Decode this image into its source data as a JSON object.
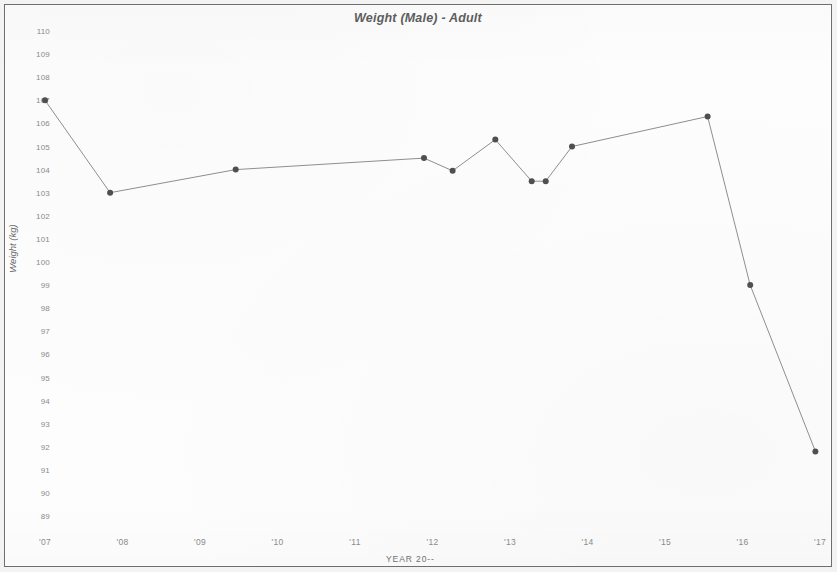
{
  "chart_data": {
    "type": "line",
    "title": "Weight (Male) - Adult",
    "xlabel": "YEAR 20--",
    "ylabel": "Weight (kg)",
    "ylim": [
      89,
      110
    ],
    "xlim": [
      2007,
      2017
    ],
    "grid": false,
    "legend": null,
    "y_ticks": [
      110,
      109,
      108,
      107,
      106,
      105,
      104,
      103,
      102,
      101,
      100,
      99,
      98,
      97,
      96,
      95,
      94,
      93,
      92,
      91,
      90,
      89
    ],
    "x_ticks": [
      2007,
      2008,
      2009,
      2010,
      2011,
      2012,
      2013,
      2014,
      2015,
      2016,
      2017
    ],
    "x_tick_labels": [
      "'07",
      "'08",
      "'09",
      "'10",
      "'11",
      "'12",
      "'13",
      "'14",
      "'15",
      "'16",
      "'17"
    ],
    "series": [
      {
        "name": "Weight (kg)",
        "color": "#555555",
        "marker": "circle",
        "x": [
          2007.0,
          2007.84,
          2009.46,
          2011.89,
          2012.26,
          2012.81,
          2013.28,
          2013.46,
          2013.8,
          2015.55,
          2016.1,
          2016.94
        ],
        "values": [
          107.0,
          103.0,
          104.0,
          104.5,
          103.95,
          105.3,
          103.5,
          103.5,
          105.0,
          106.3,
          99.0,
          91.8
        ]
      }
    ]
  },
  "style": {
    "page_background": "#f3f3f3",
    "plot_background": "#fdfdfd",
    "frame_color": "#6e6e6e",
    "line_color": "#8e8e8e",
    "marker_color": "#4f4f4f",
    "tick_label_color": "#8a8a8a",
    "title_color": "#5d5d5d"
  }
}
